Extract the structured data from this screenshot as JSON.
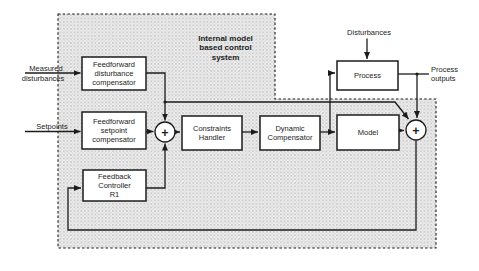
{
  "diagram": {
    "title_lines": [
      "Internal model",
      "based control",
      "system"
    ],
    "blocks": {
      "ffdc": {
        "lines": [
          "Feedforward",
          "disturbance",
          "compensator"
        ]
      },
      "ffsc": {
        "lines": [
          "Feedforward",
          "setpoint",
          "compensator"
        ]
      },
      "fbc": {
        "lines": [
          "Feedback",
          "Controller",
          "R1"
        ]
      },
      "constraints": {
        "lines": [
          "Constraints",
          "Handler"
        ]
      },
      "dynamic": {
        "lines": [
          "Dynamic",
          "Compensator"
        ]
      },
      "model": {
        "lines": [
          "Model"
        ]
      },
      "process": {
        "lines": [
          "Process"
        ]
      }
    },
    "labels": {
      "measured_line1": "Measured",
      "measured_line2": "disturbances",
      "setpoints": "Setpoints",
      "disturbances": "Disturbances",
      "process_outputs_line1": "Process",
      "process_outputs_line2": "outputs",
      "sum_plus": "+"
    },
    "colors": {
      "ink": "#1c1c1c",
      "box_fill": "#ffffff",
      "shade_base": "#ececec",
      "shade_dot": "#c0c0c0",
      "background": "#ffffff"
    }
  }
}
